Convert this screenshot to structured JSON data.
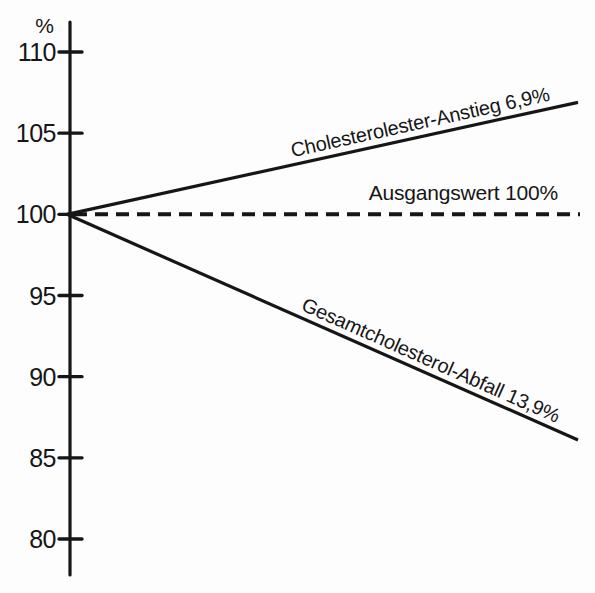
{
  "figure": {
    "background": "#fdfdfd",
    "ink": "#161616"
  },
  "chart_data": {
    "type": "line",
    "title": "",
    "xlabel": "",
    "ylabel": "%",
    "ylim": [
      78,
      112
    ],
    "y_ticks": [
      110,
      105,
      100,
      95,
      90,
      85,
      80
    ],
    "grid": false,
    "legend_position": "labels-on-lines",
    "series": [
      {
        "name": "cholesterolester-anstieg",
        "label": "Cholesterolester-Anstieg 6,9%",
        "style": "solid",
        "start_value": 100,
        "end_value": 106.9,
        "change_percent": 6.9
      },
      {
        "name": "ausgangswert",
        "label": "Ausgangswert 100%",
        "style": "dashed",
        "start_value": 100,
        "end_value": 100,
        "change_percent": 0
      },
      {
        "name": "gesamtcholesterol-abfall",
        "label": "Gesamtcholesterol-Abfall 13,9%",
        "style": "solid",
        "start_value": 100,
        "end_value": 86.1,
        "change_percent": -13.9
      }
    ]
  }
}
